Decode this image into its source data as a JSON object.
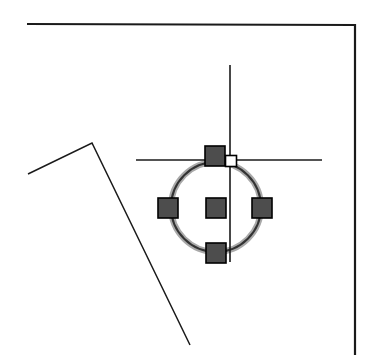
{
  "canvas": {
    "name": "cad-drawing-canvas",
    "width": 375,
    "height": 362,
    "background_color": "#ffffff",
    "title": "CAD Drawing Area"
  },
  "colors": {
    "geometry_line": "#1a1a1a",
    "grip_fill": "#4d4d4d",
    "grip_border": "#000000",
    "grip_hot_fill": "#ffffff",
    "grip_hot_border": "#000000",
    "selection_highlight": "#a9a9a9",
    "crosshair": "#1a1a1a",
    "circle_stroke": "#333333"
  },
  "entities": {
    "border_polyline": {
      "name": "border-polyline",
      "label": "Border Polyline",
      "points": "27,24 355,25 355,355",
      "stroke_width": 2.2
    },
    "wall_polyline": {
      "name": "wall-polyline",
      "label": "Wall Polyline",
      "points": "28,174 92,143 190,345",
      "stroke_width": 1.5
    },
    "selected_circle": {
      "name": "selected-circle",
      "label": "Selected Circle",
      "center_x": 216,
      "center_y": 207,
      "radius": 45,
      "stroke_width": 2.0,
      "highlight_width": 6.0,
      "selected": true
    },
    "crosshair_cursor": {
      "name": "crosshair-cursor",
      "label": "Crosshair Cursor",
      "x": 230,
      "y": 160,
      "vertical_top": 65,
      "vertical_bottom": 262,
      "horizontal_left": 136,
      "horizontal_right": 322,
      "stroke_width": 1.6
    }
  },
  "grips": {
    "label": "Circle Grip Handles",
    "size": 20,
    "items": [
      {
        "name": "grip-quadrant-top",
        "label": "Top Quadrant Grip",
        "cx": 215,
        "cy": 156,
        "state": "warm"
      },
      {
        "name": "grip-quadrant-left",
        "label": "Left Quadrant Grip",
        "cx": 168,
        "cy": 208,
        "state": "warm"
      },
      {
        "name": "grip-quadrant-right",
        "label": "Right Quadrant Grip",
        "cx": 262,
        "cy": 208,
        "state": "warm"
      },
      {
        "name": "grip-quadrant-bottom",
        "label": "Bottom Quadrant Grip",
        "cx": 216,
        "cy": 253,
        "state": "warm"
      },
      {
        "name": "grip-center",
        "label": "Center Grip",
        "cx": 216,
        "cy": 208,
        "state": "warm"
      }
    ],
    "hot_grip": {
      "name": "grip-hot-snap-marker",
      "label": "Hot Snap Marker",
      "cx": 231,
      "cy": 161,
      "size": 11,
      "state": "hot"
    }
  }
}
